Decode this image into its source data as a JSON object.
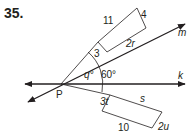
{
  "problem": {
    "number": "35."
  },
  "diagram": {
    "point": {
      "label": "P"
    },
    "lines": [
      {
        "name": "k",
        "label": "k"
      },
      {
        "name": "m",
        "label": "m"
      }
    ],
    "angles": [
      {
        "label": "q°"
      },
      {
        "label": "60°"
      }
    ],
    "upper_rectangle": {
      "side_labels": {
        "long_top": "11",
        "short_right": "4",
        "long_bottom": "2r",
        "short_left": "3"
      }
    },
    "lower_rectangle": {
      "side_labels": {
        "short_left": "3t",
        "long_top": "s",
        "long_bottom": "10",
        "short_right": "2u"
      }
    },
    "colors": {
      "ink": "#231f20",
      "background": "#ffffff"
    }
  }
}
